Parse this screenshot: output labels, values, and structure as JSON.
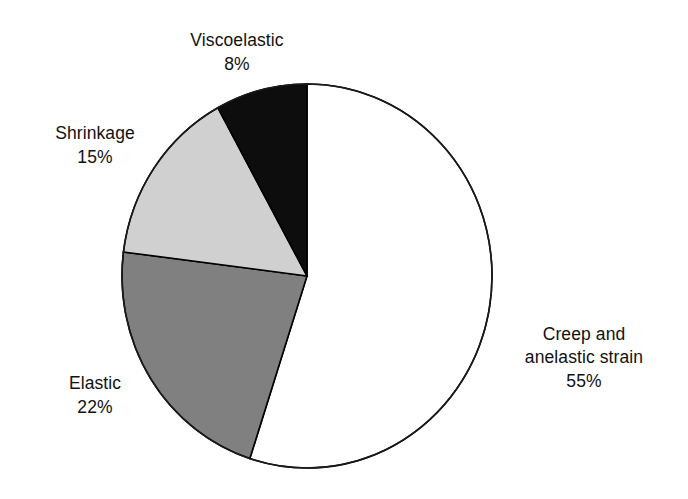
{
  "chart_data": {
    "type": "pie",
    "title": "",
    "subtitle": "",
    "xlabel": "",
    "ylabel": "",
    "grid": false,
    "legend_position": "none",
    "label_format": "name-above-percent",
    "units": "percent",
    "total": 100,
    "start_angle_deg": 0,
    "direction": "clockwise",
    "categories": [
      "Creep and anelastic strain",
      "Elastic",
      "Shrinkage",
      "Viscoelastic"
    ],
    "values": [
      55,
      22,
      15,
      8
    ],
    "slices": [
      {
        "name": "Creep and anelastic strain",
        "name_line1": "Creep and",
        "name_line2": "anelastic strain",
        "value": 55,
        "value_label": "55%",
        "color": "#ffffff",
        "start_angle_deg": 0,
        "end_angle_deg": 198,
        "label_position": "right"
      },
      {
        "name": "Elastic",
        "value": 22,
        "value_label": "22%",
        "color": "#808080",
        "start_angle_deg": 198,
        "end_angle_deg": 277.2,
        "label_position": "bottom-left"
      },
      {
        "name": "Shrinkage",
        "value": 15,
        "value_label": "15%",
        "color": "#d0d0d0",
        "start_angle_deg": 277.2,
        "end_angle_deg": 331.2,
        "label_position": "top-left"
      },
      {
        "name": "Viscoelastic",
        "value": 8,
        "value_label": "8%",
        "color": "#0d0d0d",
        "start_angle_deg": 331.2,
        "end_angle_deg": 360,
        "label_position": "top"
      }
    ],
    "outline_color": "#000000"
  },
  "labels": {
    "viscoelastic": {
      "name": "Viscoelastic",
      "value": "8%"
    },
    "shrinkage": {
      "name": "Shrinkage",
      "value": "15%"
    },
    "elastic": {
      "name": "Elastic",
      "value": "22%"
    },
    "creep": {
      "name_line1": "Creep and",
      "name_line2": "anelastic strain",
      "value": "55%"
    }
  }
}
